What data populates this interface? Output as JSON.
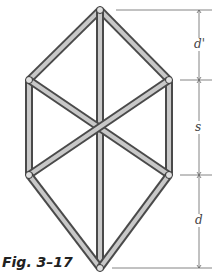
{
  "figure": {
    "caption": "Fig. 3–17",
    "dimension_labels": {
      "top": "d'",
      "middle": "s",
      "bottom": "d"
    },
    "joints": {
      "top": [
        100,
        10
      ],
      "upper_left": [
        29,
        80
      ],
      "upper_right": [
        169,
        80
      ],
      "lower_left": [
        29,
        175
      ],
      "lower_right": [
        169,
        175
      ],
      "bottom": [
        100,
        268
      ]
    },
    "bars": [
      [
        "top",
        "upper_left"
      ],
      [
        "top",
        "upper_right"
      ],
      [
        "top",
        "bottom"
      ],
      [
        "upper_left",
        "lower_left"
      ],
      [
        "upper_right",
        "lower_right"
      ],
      [
        "upper_left",
        "lower_right"
      ],
      [
        "upper_right",
        "lower_left"
      ],
      [
        "lower_left",
        "bottom"
      ],
      [
        "lower_right",
        "bottom"
      ]
    ],
    "colors": {
      "bar_dark": "#555555",
      "bar_light": "#d8d8d8",
      "line": "#666666"
    }
  }
}
